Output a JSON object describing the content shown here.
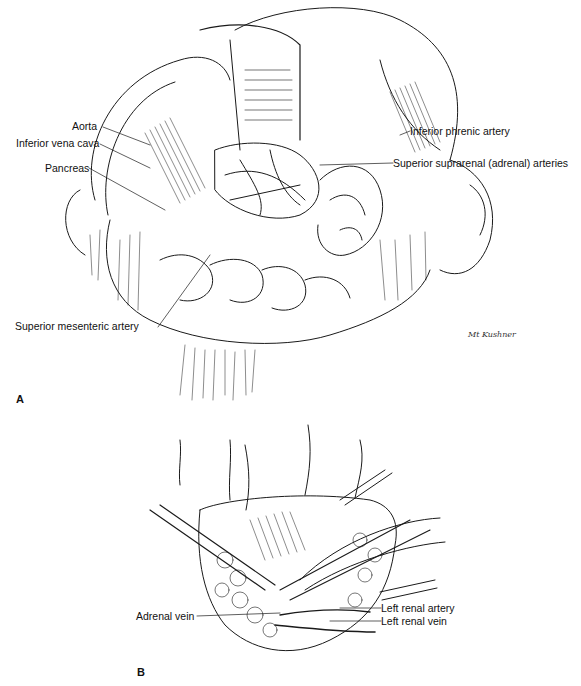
{
  "figure": {
    "panels": [
      {
        "id": "A",
        "letter": "A",
        "labels": {
          "aorta": "Aorta",
          "ivc": "Inferior vena cava",
          "pancreas": "Pancreas",
          "inferior_phrenic": "Inferior phrenic artery",
          "superior_suprarenal": "Superior suprarenal (adrenal) arteries",
          "sma": "Superior mesenteric artery"
        },
        "signature": "Mt Kushner"
      },
      {
        "id": "B",
        "letter": "B",
        "labels": {
          "adrenal_vein": "Adrenal vein",
          "left_renal_artery": "Left renal artery",
          "left_renal_vein": "Left renal vein"
        }
      }
    ],
    "colors": {
      "ink": "#111111",
      "background": "#ffffff"
    }
  }
}
